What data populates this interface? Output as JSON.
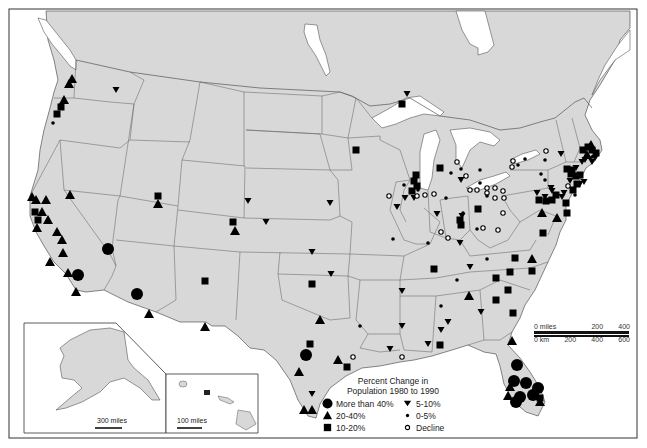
{
  "map": {
    "title": "Percent Change in Population 1980 to 1990",
    "land_color": "#d8d8d8",
    "water_color": "#ffffff",
    "border_color": "#555555"
  },
  "legend": {
    "title_line1": "Percent Change in",
    "title_line2": "Population 1980 to 1990",
    "items": [
      {
        "symbol": "large-circle",
        "label": "More than 40%"
      },
      {
        "symbol": "down-triangle",
        "label": "5-10%"
      },
      {
        "symbol": "triangle",
        "label": "20-40%"
      },
      {
        "symbol": "small-dot",
        "label": "0-5%"
      },
      {
        "symbol": "square",
        "label": "10-20%"
      },
      {
        "symbol": "open-circle",
        "label": "Decline"
      }
    ]
  },
  "scale_bar": {
    "miles_label": "0 miles",
    "miles_ticks": [
      "200",
      "400"
    ],
    "km_label": "0 km",
    "km_ticks": [
      "200",
      "400",
      "600"
    ]
  },
  "insets": {
    "alaska_scale": "300 miles",
    "hawaii_scale": "100 miles"
  },
  "markers": [
    {
      "t": "tri",
      "x": 72,
      "y": 79
    },
    {
      "t": "tri",
      "x": 69,
      "y": 84
    },
    {
      "t": "tri",
      "x": 64,
      "y": 100
    },
    {
      "t": "sq",
      "x": 61,
      "y": 107
    },
    {
      "t": "sq",
      "x": 57,
      "y": 114
    },
    {
      "t": "dot",
      "x": 53,
      "y": 123
    },
    {
      "t": "inv",
      "x": 116,
      "y": 90
    },
    {
      "t": "tri",
      "x": 32,
      "y": 197
    },
    {
      "t": "tri",
      "x": 36,
      "y": 200
    },
    {
      "t": "tri",
      "x": 46,
      "y": 200
    },
    {
      "t": "sq",
      "x": 35,
      "y": 212
    },
    {
      "t": "tri",
      "x": 42,
      "y": 212
    },
    {
      "t": "sq",
      "x": 38,
      "y": 220
    },
    {
      "t": "tri",
      "x": 48,
      "y": 220
    },
    {
      "t": "tri",
      "x": 37,
      "y": 228
    },
    {
      "t": "tri",
      "x": 57,
      "y": 232
    },
    {
      "t": "tri",
      "x": 62,
      "y": 240
    },
    {
      "t": "tri",
      "x": 63,
      "y": 253
    },
    {
      "t": "tri",
      "x": 50,
      "y": 262
    },
    {
      "t": "tri",
      "x": 70,
      "y": 195
    },
    {
      "t": "big",
      "x": 108,
      "y": 249
    },
    {
      "t": "tri",
      "x": 68,
      "y": 273
    },
    {
      "t": "big",
      "x": 78,
      "y": 275
    },
    {
      "t": "tri",
      "x": 76,
      "y": 292
    },
    {
      "t": "big",
      "x": 137,
      "y": 294
    },
    {
      "t": "tri",
      "x": 149,
      "y": 314
    },
    {
      "t": "tri",
      "x": 205,
      "y": 327
    },
    {
      "t": "sq",
      "x": 158,
      "y": 196
    },
    {
      "t": "tri",
      "x": 158,
      "y": 204
    },
    {
      "t": "sq",
      "x": 233,
      "y": 222
    },
    {
      "t": "tri",
      "x": 235,
      "y": 231
    },
    {
      "t": "sq",
      "x": 205,
      "y": 281
    },
    {
      "t": "sq",
      "x": 356,
      "y": 150
    },
    {
      "t": "inv",
      "x": 330,
      "y": 203
    },
    {
      "t": "inv",
      "x": 312,
      "y": 252
    },
    {
      "t": "inv",
      "x": 266,
      "y": 222
    },
    {
      "t": "inv",
      "x": 248,
      "y": 201
    },
    {
      "t": "sq",
      "x": 312,
      "y": 284
    },
    {
      "t": "inv",
      "x": 331,
      "y": 274
    },
    {
      "t": "tri",
      "x": 320,
      "y": 320
    },
    {
      "t": "sq",
      "x": 310,
      "y": 344
    },
    {
      "t": "big",
      "x": 306,
      "y": 355
    },
    {
      "t": "tri",
      "x": 299,
      "y": 372
    },
    {
      "t": "tri",
      "x": 338,
      "y": 360
    },
    {
      "t": "sq",
      "x": 347,
      "y": 367
    },
    {
      "t": "o",
      "x": 353,
      "y": 357
    },
    {
      "t": "inv",
      "x": 402,
      "y": 291
    },
    {
      "t": "dot",
      "x": 360,
      "y": 326
    },
    {
      "t": "inv",
      "x": 402,
      "y": 326
    },
    {
      "t": "inv",
      "x": 312,
      "y": 394
    },
    {
      "t": "tri",
      "x": 304,
      "y": 410
    },
    {
      "t": "tri",
      "x": 312,
      "y": 410
    },
    {
      "t": "inv",
      "x": 441,
      "y": 330
    },
    {
      "t": "inv",
      "x": 390,
      "y": 349
    },
    {
      "t": "o",
      "x": 402,
      "y": 357
    },
    {
      "t": "inv",
      "x": 428,
      "y": 344
    },
    {
      "t": "sq",
      "x": 440,
      "y": 345
    },
    {
      "t": "dot",
      "x": 441,
      "y": 306
    },
    {
      "t": "inv",
      "x": 448,
      "y": 322
    },
    {
      "t": "tri",
      "x": 469,
      "y": 296
    },
    {
      "t": "inv",
      "x": 481,
      "y": 312
    },
    {
      "t": "sq",
      "x": 496,
      "y": 300
    },
    {
      "t": "sq",
      "x": 513,
      "y": 313
    },
    {
      "t": "tri",
      "x": 512,
      "y": 341
    },
    {
      "t": "sq",
      "x": 434,
      "y": 269
    },
    {
      "t": "inv",
      "x": 470,
      "y": 267
    },
    {
      "t": "dot",
      "x": 457,
      "y": 280
    },
    {
      "t": "dot",
      "x": 487,
      "y": 259
    },
    {
      "t": "sq",
      "x": 515,
      "y": 258
    },
    {
      "t": "tri",
      "x": 532,
      "y": 259
    },
    {
      "t": "sq",
      "x": 510,
      "y": 272
    },
    {
      "t": "sq",
      "x": 532,
      "y": 271
    },
    {
      "t": "sq",
      "x": 496,
      "y": 278
    },
    {
      "t": "sq",
      "x": 508,
      "y": 290
    },
    {
      "t": "big",
      "x": 517,
      "y": 365
    },
    {
      "t": "big",
      "x": 514,
      "y": 381
    },
    {
      "t": "big",
      "x": 526,
      "y": 383
    },
    {
      "t": "big",
      "x": 533,
      "y": 395
    },
    {
      "t": "big",
      "x": 520,
      "y": 397
    },
    {
      "t": "big",
      "x": 538,
      "y": 388
    },
    {
      "t": "tri",
      "x": 510,
      "y": 387
    },
    {
      "t": "tri",
      "x": 508,
      "y": 396
    },
    {
      "t": "big",
      "x": 516,
      "y": 402
    },
    {
      "t": "tri",
      "x": 540,
      "y": 402
    },
    {
      "t": "sq",
      "x": 540,
      "y": 398
    },
    {
      "t": "inv",
      "x": 407,
      "y": 94
    },
    {
      "t": "sq",
      "x": 402,
      "y": 104
    },
    {
      "t": "sq",
      "x": 416,
      "y": 175
    },
    {
      "t": "sq",
      "x": 414,
      "y": 181
    },
    {
      "t": "sq",
      "x": 417,
      "y": 186
    },
    {
      "t": "dot",
      "x": 404,
      "y": 185
    },
    {
      "t": "sq",
      "x": 412,
      "y": 191
    },
    {
      "t": "inv",
      "x": 414,
      "y": 198
    },
    {
      "t": "inv",
      "x": 405,
      "y": 198
    },
    {
      "t": "dot",
      "x": 418,
      "y": 190
    },
    {
      "t": "o",
      "x": 389,
      "y": 196
    },
    {
      "t": "inv",
      "x": 397,
      "y": 207
    },
    {
      "t": "dot",
      "x": 393,
      "y": 239
    },
    {
      "t": "o",
      "x": 425,
      "y": 195
    },
    {
      "t": "dot",
      "x": 446,
      "y": 198
    },
    {
      "t": "inv",
      "x": 437,
      "y": 214
    },
    {
      "t": "dot",
      "x": 428,
      "y": 243
    },
    {
      "t": "o",
      "x": 448,
      "y": 238
    },
    {
      "t": "inv",
      "x": 460,
      "y": 243
    },
    {
      "t": "sq",
      "x": 440,
      "y": 168
    },
    {
      "t": "o",
      "x": 457,
      "y": 162
    },
    {
      "t": "dot",
      "x": 461,
      "y": 169
    },
    {
      "t": "inv",
      "x": 461,
      "y": 180
    },
    {
      "t": "o",
      "x": 466,
      "y": 176
    },
    {
      "t": "dot",
      "x": 451,
      "y": 173
    },
    {
      "t": "dot",
      "x": 480,
      "y": 170
    },
    {
      "t": "o",
      "x": 470,
      "y": 190
    },
    {
      "t": "dot",
      "x": 480,
      "y": 183
    },
    {
      "t": "o",
      "x": 487,
      "y": 188
    },
    {
      "t": "o",
      "x": 495,
      "y": 188
    },
    {
      "t": "o",
      "x": 487,
      "y": 193
    },
    {
      "t": "o",
      "x": 495,
      "y": 198
    },
    {
      "t": "o",
      "x": 477,
      "y": 190
    },
    {
      "t": "o",
      "x": 503,
      "y": 191
    },
    {
      "t": "sq",
      "x": 478,
      "y": 209
    },
    {
      "t": "inv",
      "x": 462,
      "y": 216
    },
    {
      "t": "dot",
      "x": 463,
      "y": 213
    },
    {
      "t": "sq",
      "x": 460,
      "y": 220
    },
    {
      "t": "sq",
      "x": 461,
      "y": 225
    },
    {
      "t": "dot",
      "x": 477,
      "y": 229
    },
    {
      "t": "o",
      "x": 483,
      "y": 228
    },
    {
      "t": "o",
      "x": 498,
      "y": 230
    },
    {
      "t": "o",
      "x": 441,
      "y": 232
    },
    {
      "t": "o",
      "x": 417,
      "y": 196
    },
    {
      "t": "o",
      "x": 434,
      "y": 194
    },
    {
      "t": "o",
      "x": 512,
      "y": 167
    },
    {
      "t": "dot",
      "x": 518,
      "y": 165
    },
    {
      "t": "o",
      "x": 513,
      "y": 161
    },
    {
      "t": "dot",
      "x": 525,
      "y": 159
    },
    {
      "t": "dot",
      "x": 545,
      "y": 160
    },
    {
      "t": "o",
      "x": 546,
      "y": 151
    },
    {
      "t": "dot",
      "x": 541,
      "y": 174
    },
    {
      "t": "inv",
      "x": 561,
      "y": 154
    },
    {
      "t": "dot",
      "x": 545,
      "y": 180
    },
    {
      "t": "o",
      "x": 504,
      "y": 198
    },
    {
      "t": "o",
      "x": 503,
      "y": 213
    },
    {
      "t": "dot",
      "x": 487,
      "y": 196
    },
    {
      "t": "inv",
      "x": 537,
      "y": 193
    },
    {
      "t": "sq",
      "x": 539,
      "y": 200
    },
    {
      "t": "inv",
      "x": 545,
      "y": 197
    },
    {
      "t": "sq",
      "x": 546,
      "y": 201
    },
    {
      "t": "inv",
      "x": 551,
      "y": 188
    },
    {
      "t": "inv",
      "x": 552,
      "y": 191
    },
    {
      "t": "sq",
      "x": 556,
      "y": 195
    },
    {
      "t": "sq",
      "x": 552,
      "y": 200
    },
    {
      "t": "inv",
      "x": 564,
      "y": 193
    },
    {
      "t": "sq",
      "x": 566,
      "y": 203
    },
    {
      "t": "sq",
      "x": 567,
      "y": 213
    },
    {
      "t": "tri",
      "x": 542,
      "y": 213
    },
    {
      "t": "tri",
      "x": 557,
      "y": 218
    },
    {
      "t": "sq",
      "x": 543,
      "y": 233
    },
    {
      "t": "sq",
      "x": 567,
      "y": 169
    },
    {
      "t": "sq",
      "x": 572,
      "y": 170
    },
    {
      "t": "inv",
      "x": 576,
      "y": 168
    },
    {
      "t": "sq",
      "x": 571,
      "y": 174
    },
    {
      "t": "sq",
      "x": 576,
      "y": 176
    },
    {
      "t": "sq",
      "x": 580,
      "y": 175
    },
    {
      "t": "inv",
      "x": 570,
      "y": 181
    },
    {
      "t": "sq",
      "x": 577,
      "y": 184
    },
    {
      "t": "sq",
      "x": 573,
      "y": 190
    },
    {
      "t": "inv",
      "x": 580,
      "y": 184
    },
    {
      "t": "inv",
      "x": 584,
      "y": 182
    },
    {
      "t": "o",
      "x": 568,
      "y": 186
    },
    {
      "t": "sq",
      "x": 583,
      "y": 150
    },
    {
      "t": "sq",
      "x": 588,
      "y": 147
    },
    {
      "t": "tri",
      "x": 591,
      "y": 145
    },
    {
      "t": "sq",
      "x": 592,
      "y": 150
    },
    {
      "t": "tri",
      "x": 587,
      "y": 155
    },
    {
      "t": "sq",
      "x": 596,
      "y": 153
    },
    {
      "t": "inv",
      "x": 592,
      "y": 162
    },
    {
      "t": "inv",
      "x": 595,
      "y": 158
    },
    {
      "t": "inv",
      "x": 582,
      "y": 162
    },
    {
      "t": "inv",
      "x": 585,
      "y": 160
    },
    {
      "t": "dot",
      "x": 592,
      "y": 157
    },
    {
      "t": "dot",
      "x": 575,
      "y": 195
    },
    {
      "t": "inv",
      "x": 562,
      "y": 197
    }
  ]
}
